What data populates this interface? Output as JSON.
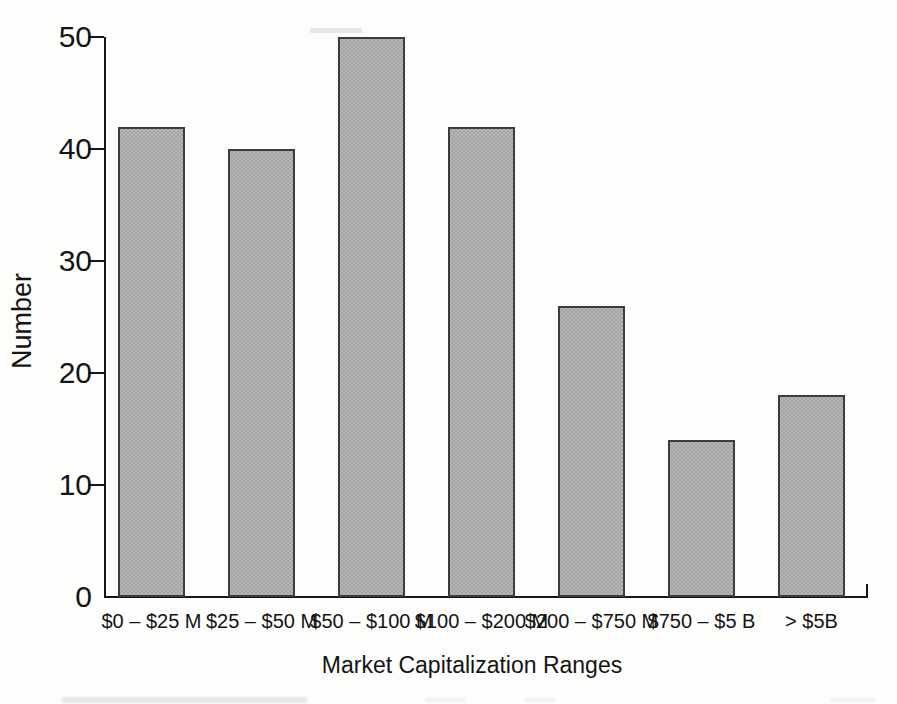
{
  "figure": {
    "y_axis_title": "Number",
    "x_axis_title": "Market Capitalization Ranges"
  },
  "chart_data": {
    "type": "bar",
    "title": "",
    "xlabel": "Market Capitalization Ranges",
    "ylabel": "Number",
    "categories": [
      "$0 – $25 M",
      "$25 – $50 M",
      "$50 – $100 M",
      "$100 – $200 M",
      "$200 – $750 M",
      "$750 – $5 B",
      "> $5B"
    ],
    "values": [
      42,
      40,
      50,
      42,
      26,
      14,
      18
    ],
    "ylim": [
      0,
      50
    ],
    "yticks": [
      0,
      10,
      20,
      30,
      40,
      50
    ],
    "grid": false,
    "legend": false,
    "colors": {
      "bar_fill": "#b7b7b5",
      "bar_dot": "#a3a3a1",
      "bar_border": "#3c3c3c",
      "axis": "#161616",
      "text": "#141414",
      "background": "#fdfdfc"
    }
  }
}
